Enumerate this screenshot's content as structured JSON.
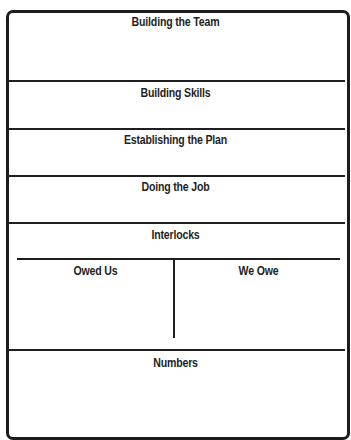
{
  "form": {
    "sections": [
      {
        "title": "Building the Team"
      },
      {
        "title": "Building Skills"
      },
      {
        "title": "Establishing the Plan"
      },
      {
        "title": "Doing the Job"
      },
      {
        "title": "Interlocks",
        "columns": [
          {
            "title": "Owed Us"
          },
          {
            "title": "We Owe"
          }
        ]
      },
      {
        "title": "Numbers"
      }
    ]
  },
  "colors": {
    "line": "#1f1f1f",
    "background": "#ffffff"
  }
}
